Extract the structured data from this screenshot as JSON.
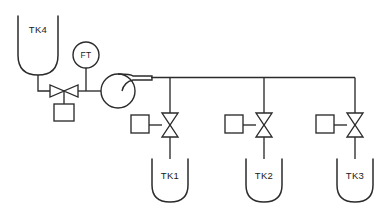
{
  "diagram": {
    "type": "piping-and-instrumentation-diagram",
    "background_color": "#ffffff",
    "line_color": "#2b2b2b",
    "text_color": "#1a1a1a",
    "source_tank": {
      "id": "TK4",
      "label": "TK4",
      "shape": "u-bottom-vessel"
    },
    "instrument": {
      "id": "FT",
      "label": "FT",
      "shape": "circle-bubble"
    },
    "pump": {
      "shape": "circle-with-tangential-discharge",
      "label": ""
    },
    "feed_valve": {
      "label": "",
      "type": "control-valve-bowtie-horizontal",
      "actuator": "square-box-below"
    },
    "branches": [
      {
        "tank_id": "TK1",
        "tank_label": "TK1",
        "valve_label": "",
        "valve_type": "control-valve-bowtie-vertical",
        "actuator": "square-box-left"
      },
      {
        "tank_id": "TK2",
        "tank_label": "TK2",
        "valve_label": "",
        "valve_type": "control-valve-bowtie-vertical",
        "actuator": "square-box-left"
      },
      {
        "tank_id": "TK3",
        "tank_label": "TK3",
        "valve_label": "",
        "valve_type": "control-valve-bowtie-vertical",
        "actuator": "square-box-left"
      }
    ]
  }
}
